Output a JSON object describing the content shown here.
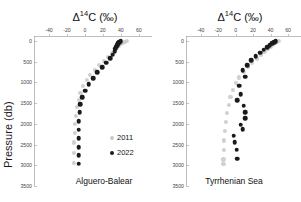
{
  "figure": {
    "ylabel": "Pressure (db)",
    "axis_title_main": "C (",
    "axis_title_delta": "Δ",
    "axis_title_sup": "14",
    "axis_title_unit": "‰)",
    "axis_title_full": "Δ14C (‰)"
  },
  "legend": {
    "title": "",
    "items": [
      {
        "label": "2011",
        "color": "#c8c8c8"
      },
      {
        "label": "2022",
        "color": "#1a1a1a"
      }
    ]
  },
  "chart_data": [
    {
      "type": "scatter",
      "title": "Alguero-Balear",
      "xlabel": "Δ14C (‰)",
      "ylabel": "Pressure (db)",
      "xlim": [
        -50,
        68
      ],
      "ylim": [
        3500,
        -120
      ],
      "xticks": [
        -40,
        -20,
        0,
        20,
        40,
        60
      ],
      "yticks": [
        0,
        500,
        1000,
        1500,
        2000,
        2500,
        3000,
        3500
      ],
      "grid": false,
      "legend_position": "inside-right",
      "series": [
        {
          "name": "2011",
          "color": "#c8c8c8",
          "x": [
            47,
            44,
            42,
            40,
            38,
            36,
            33,
            30,
            26,
            21,
            16,
            11,
            6,
            2,
            -2,
            -5,
            -7,
            -9,
            -10,
            -11,
            -11,
            -12,
            -12,
            -12
          ],
          "y": [
            5,
            20,
            40,
            70,
            110,
            160,
            220,
            300,
            390,
            480,
            580,
            690,
            810,
            940,
            1080,
            1250,
            1420,
            1600,
            1800,
            2000,
            2220,
            2450,
            2700,
            2950
          ]
        },
        {
          "name": "2022",
          "color": "#1a1a1a",
          "x": [
            40,
            38,
            37,
            36,
            35,
            34,
            33,
            31,
            28,
            24,
            19,
            14,
            9,
            4,
            0,
            -3,
            -5,
            -6,
            -7,
            -7,
            -7,
            -7,
            -7,
            -7
          ],
          "y": [
            5,
            25,
            55,
            95,
            140,
            190,
            250,
            330,
            420,
            520,
            640,
            760,
            900,
            1050,
            1200,
            1360,
            1530,
            1720,
            1930,
            2140,
            2350,
            2560,
            2760,
            2960
          ]
        }
      ]
    },
    {
      "type": "scatter",
      "title": "Tyrrhenian Sea",
      "xlabel": "Δ14C (‰)",
      "ylabel": "Pressure (db)",
      "xlim": [
        -50,
        68
      ],
      "ylim": [
        3500,
        -120
      ],
      "xticks": [
        -40,
        -20,
        0,
        20,
        40,
        60
      ],
      "yticks": [
        0,
        500,
        1000,
        1500,
        2000,
        2500,
        3000,
        3500
      ],
      "grid": false,
      "legend_position": "none",
      "series": [
        {
          "name": "2011",
          "color": "#c8c8c8",
          "x": [
            50,
            47,
            45,
            43,
            40,
            37,
            33,
            29,
            24,
            19,
            14,
            9,
            4,
            0,
            -3,
            -6,
            -8,
            -10,
            -11,
            -12,
            -13,
            -13,
            -14,
            -14
          ],
          "y": [
            5,
            25,
            50,
            85,
            130,
            185,
            250,
            330,
            420,
            520,
            630,
            750,
            880,
            1020,
            1180,
            1350,
            1540,
            1740,
            1950,
            2170,
            2400,
            2630,
            2860,
            2960
          ]
        },
        {
          "name": "2022",
          "color": "#1a1a1a",
          "x": [
            46,
            44,
            42,
            39,
            36,
            32,
            28,
            23,
            18,
            13,
            8,
            11,
            4,
            6,
            2,
            9,
            11,
            11,
            6,
            8,
            -2,
            -1,
            1,
            2
          ],
          "y": [
            8,
            30,
            60,
            100,
            150,
            210,
            280,
            370,
            470,
            580,
            700,
            860,
            1080,
            1280,
            1430,
            1560,
            1720,
            1860,
            2020,
            2130,
            2290,
            2450,
            2620,
            2840
          ]
        }
      ]
    }
  ]
}
